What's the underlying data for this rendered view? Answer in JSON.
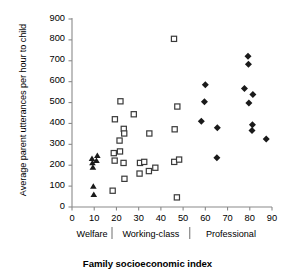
{
  "chart_data": {
    "type": "scatter",
    "title": "",
    "xlabel": "Family socioeconomic index",
    "ylabel": "Average parent utterances  per hour to child",
    "xlim": [
      0,
      90
    ],
    "ylim": [
      0,
      900
    ],
    "xticks": [
      0,
      10,
      20,
      30,
      40,
      50,
      60,
      70,
      80,
      90
    ],
    "yticks": [
      0,
      100,
      200,
      300,
      400,
      500,
      600,
      700,
      800,
      900
    ],
    "grid": false,
    "legend": "none",
    "group_bands": [
      {
        "label": "Welfare",
        "x_start": 0,
        "x_end": 18,
        "marker": "filled-triangle"
      },
      {
        "label": "Working-class",
        "x_start": 18,
        "x_end": 53,
        "marker": "open-square"
      },
      {
        "label": "Professional",
        "x_start": 53,
        "x_end": 90,
        "marker": "filled-diamond"
      }
    ],
    "series": [
      {
        "name": "Welfare",
        "marker": "filled-triangle",
        "color": "#000000",
        "points": [
          {
            "x": 9.0,
            "y": 232
          },
          {
            "x": 9.2,
            "y": 211
          },
          {
            "x": 9.4,
            "y": 190
          },
          {
            "x": 11.4,
            "y": 246
          },
          {
            "x": 11.0,
            "y": 222
          },
          {
            "x": 9.6,
            "y": 99
          },
          {
            "x": 9.8,
            "y": 59
          }
        ]
      },
      {
        "name": "Working-class",
        "marker": "open-square",
        "color": "#000000",
        "points": [
          {
            "x": 18.3,
            "y": 78
          },
          {
            "x": 19.3,
            "y": 420
          },
          {
            "x": 18.8,
            "y": 258
          },
          {
            "x": 19.2,
            "y": 222
          },
          {
            "x": 21.8,
            "y": 506
          },
          {
            "x": 21.4,
            "y": 318
          },
          {
            "x": 21.6,
            "y": 266
          },
          {
            "x": 23.3,
            "y": 374
          },
          {
            "x": 23.5,
            "y": 352
          },
          {
            "x": 23.2,
            "y": 211
          },
          {
            "x": 23.6,
            "y": 135
          },
          {
            "x": 27.8,
            "y": 444
          },
          {
            "x": 30.6,
            "y": 211
          },
          {
            "x": 30.4,
            "y": 160
          },
          {
            "x": 32.5,
            "y": 216
          },
          {
            "x": 34.8,
            "y": 352
          },
          {
            "x": 34.6,
            "y": 172
          },
          {
            "x": 37.5,
            "y": 188
          },
          {
            "x": 45.9,
            "y": 805
          },
          {
            "x": 46.2,
            "y": 372
          },
          {
            "x": 46.0,
            "y": 216
          },
          {
            "x": 47.4,
            "y": 481
          },
          {
            "x": 48.2,
            "y": 227
          },
          {
            "x": 47.2,
            "y": 46
          }
        ]
      },
      {
        "name": "Professional",
        "marker": "filled-diamond",
        "color": "#000000",
        "points": [
          {
            "x": 58.2,
            "y": 411
          },
          {
            "x": 59.6,
            "y": 504
          },
          {
            "x": 60.0,
            "y": 585
          },
          {
            "x": 65.4,
            "y": 379
          },
          {
            "x": 65.2,
            "y": 236
          },
          {
            "x": 77.6,
            "y": 567
          },
          {
            "x": 79.2,
            "y": 722
          },
          {
            "x": 79.4,
            "y": 683
          },
          {
            "x": 79.6,
            "y": 498
          },
          {
            "x": 81.4,
            "y": 538
          },
          {
            "x": 81.2,
            "y": 394
          },
          {
            "x": 81.0,
            "y": 366
          },
          {
            "x": 87.4,
            "y": 325
          }
        ]
      }
    ]
  },
  "axis": {
    "x_title": "Family socioeconomic index",
    "y_title": "Average parent utterances  per hour to child",
    "x_tick_labels": [
      "0",
      "10",
      "20",
      "30",
      "40",
      "50",
      "60",
      "70",
      "80",
      "90"
    ],
    "y_tick_labels": [
      "0",
      "100",
      "200",
      "300",
      "400",
      "500",
      "600",
      "700",
      "800",
      "900"
    ]
  },
  "groups": {
    "welfare": "Welfare",
    "working_class": "Working-class",
    "professional": "Professional"
  },
  "colors": {
    "axis": "#8a8a8a",
    "marker": "#1a1a1a",
    "text": "#000000"
  }
}
